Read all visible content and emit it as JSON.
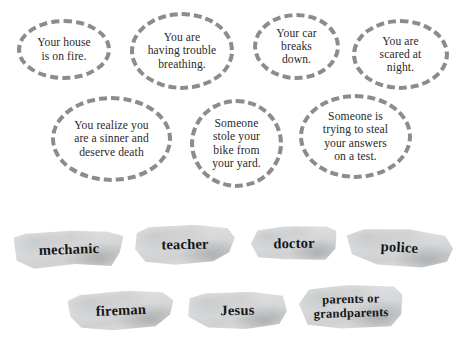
{
  "worksheet": {
    "background_color": "#ffffff",
    "bubble_outline_color": "#8c8c8c",
    "bubble_text_color": "#2a2a2a",
    "strip_paper_color": "#d9dbdc",
    "strip_text_color": "#161616"
  },
  "scenarios": [
    {
      "text": "Your house\nis on fire."
    },
    {
      "text": "You are\nhaving trouble\nbreathing."
    },
    {
      "text": "Your car\nbreaks\ndown."
    },
    {
      "text": "You are\nscared at\nnight."
    },
    {
      "text": "You realize you\nare a sinner and\ndeserve death"
    },
    {
      "text": "Someone\nstole your\nbike from\nyour yard."
    },
    {
      "text": "Someone is\ntrying to steal\nyour answers\non a test."
    }
  ],
  "helpers": [
    {
      "label": "mechanic"
    },
    {
      "label": "teacher"
    },
    {
      "label": "doctor"
    },
    {
      "label": "police"
    },
    {
      "label": "fireman"
    },
    {
      "label": "Jesus"
    },
    {
      "label": "parents or\ngrandparents"
    }
  ]
}
